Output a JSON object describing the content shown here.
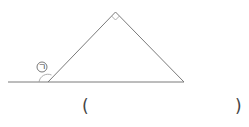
{
  "diagram": {
    "type": "geometry-triangle-exterior-angle",
    "angle_label": "ㄱ",
    "right_angle_marker": true,
    "answer_blank": {
      "open": "(",
      "close": ")",
      "value": ""
    },
    "colors": {
      "line": "#7a7a7a",
      "text": "#444444"
    }
  }
}
